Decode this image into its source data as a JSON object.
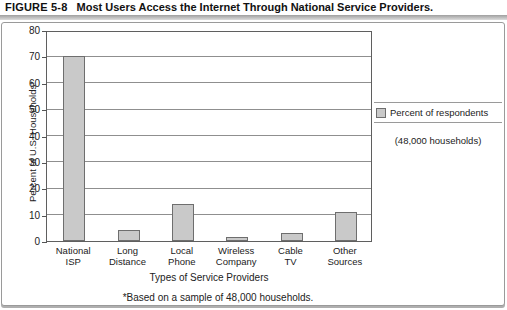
{
  "figure": {
    "label": "FIGURE 5-8",
    "title": "Most Users Access the Internet Through National Service Providers."
  },
  "legend": {
    "swatch_color": "#c9c9c9",
    "label": "Percent of respondents",
    "sublabel": "(48,000 households)"
  },
  "footnote": "*Based on a sample of 48,000 households.",
  "chart_data": {
    "type": "bar",
    "title": "Most Users Access the Internet Through National Service Providers.",
    "categories": [
      "National ISP",
      "Long Distance",
      "Local Phone",
      "Wireless Company",
      "Cable TV",
      "Other Sources"
    ],
    "category_lines": [
      [
        "National",
        "ISP"
      ],
      [
        "Long",
        "Distance"
      ],
      [
        "Local",
        "Phone"
      ],
      [
        "Wireless",
        "Company"
      ],
      [
        "Cable",
        "TV"
      ],
      [
        "Other",
        "Sources"
      ]
    ],
    "values": [
      70,
      4,
      14,
      1.5,
      3,
      11
    ],
    "xlabel": "Types of Service Providers",
    "ylabel": "Percent of U.S. Households*",
    "ylim": [
      0,
      80
    ],
    "ytick_step": 10,
    "grid": true,
    "legend_position": "right",
    "bar_fill": "#c9c9c9",
    "bar_border": "#6e6e6e",
    "gridline_color": "#8f8f8f"
  }
}
